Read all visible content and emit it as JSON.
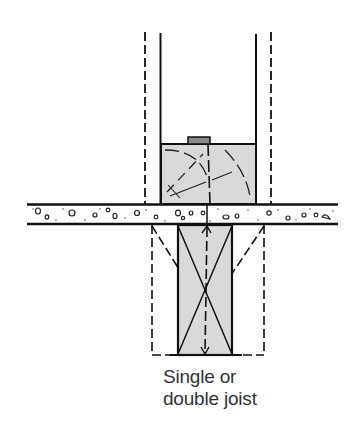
{
  "diagram": {
    "type": "construction-section",
    "label": {
      "line1": "Single or",
      "line2": "double joist"
    },
    "colors": {
      "line": "#111111",
      "fill": "#d9d9d9",
      "background": "#ffffff",
      "text": "#333333"
    },
    "elements": [
      "upper-wall-left-solid",
      "upper-wall-left-dashed",
      "upper-wall-right-solid",
      "upper-wall-right-dashed",
      "top-plate-block",
      "block-cap",
      "floor-slab",
      "joist",
      "joist-dashed-outline"
    ]
  }
}
